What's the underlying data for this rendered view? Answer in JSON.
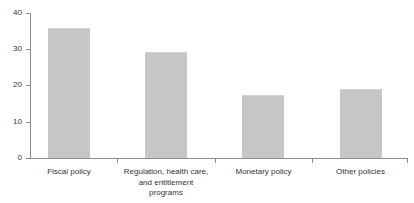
{
  "chart_data": {
    "type": "bar",
    "title": "",
    "subtitle": "",
    "xlabel": "",
    "ylabel": "",
    "categories": [
      "Fiscal policy",
      "Regulation, health care, and entitlement programs",
      "Monetary policy",
      "Other policies"
    ],
    "category_lines": [
      [
        "Fiscal policy"
      ],
      [
        "Regulation, health care,",
        "and entitlement",
        "programs"
      ],
      [
        "Monetary policy"
      ],
      [
        "Other policies"
      ]
    ],
    "values": [
      35.8,
      29.2,
      17.4,
      19.0
    ],
    "ylim": [
      0,
      40
    ],
    "yticks": [
      0,
      10,
      20,
      30,
      40
    ],
    "ytick_labels": [
      "0",
      "10",
      "20",
      "30",
      "40"
    ],
    "grid": false,
    "legend": "none",
    "bar_color": "#c6c6c6",
    "axis_color": "#8c8c8c",
    "text_color": "#333333",
    "background": "#ffffff"
  }
}
